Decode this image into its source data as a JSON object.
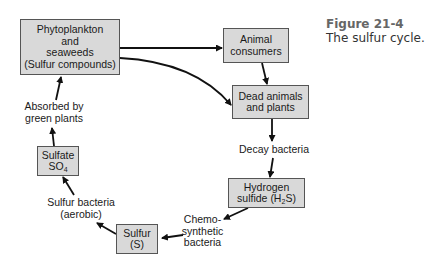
{
  "caption": {
    "figure_number": "Figure 21-4",
    "title": "The sulfur cycle."
  },
  "nodes": {
    "phytoplankton": {
      "lines": [
        "Phytoplankton",
        "and",
        "seaweeds",
        "(Sulfur compounds)"
      ]
    },
    "animal_consumers": {
      "lines": [
        "Animal",
        "consumers"
      ]
    },
    "dead_matter": {
      "lines": [
        "Dead animals",
        "and plants"
      ]
    },
    "hydrogen_sulfide": {
      "line1": "Hydrogen",
      "line2_pre": "sulfide (H",
      "line2_sub": "2",
      "line2_post": "S)"
    },
    "sulfur": {
      "lines": [
        "Sulfur",
        "(S)"
      ]
    },
    "sulfate": {
      "line1": "Sulfate",
      "line2_pre": "SO",
      "line2_sub": "4"
    }
  },
  "edge_labels": {
    "decay": "Decay bacteria",
    "chemosynthetic": [
      "Chemo-",
      "synthetic",
      "bacteria"
    ],
    "sulfur_bacteria": [
      "Sulfur bacteria",
      "(aerobic)"
    ],
    "absorbed": [
      "Absorbed by",
      "green plants"
    ]
  },
  "colors": {
    "box_fill": "#d9d9d9",
    "box_border": "#555555",
    "arrow": "#111111",
    "caption_label": "#666666"
  }
}
